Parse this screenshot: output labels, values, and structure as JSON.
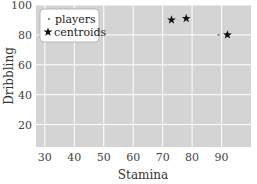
{
  "chart_data": {
    "type": "scatter",
    "title": "",
    "xlabel": "Stamina",
    "ylabel": "Dribbling",
    "xlim": [
      27,
      100
    ],
    "ylim": [
      5,
      100
    ],
    "xticks": [
      30,
      40,
      50,
      60,
      70,
      80,
      90
    ],
    "yticks": [
      20,
      40,
      60,
      80,
      100
    ],
    "grid": true,
    "background": "#d4d4d4",
    "legend_position": "upper left",
    "series": [
      {
        "name": "players",
        "marker": "dot",
        "color": "#888888",
        "points": [
          [
            89,
            80
          ]
        ]
      },
      {
        "name": "centroids",
        "marker": "star",
        "color": "#111111",
        "points": [
          [
            73,
            90
          ],
          [
            78,
            91
          ],
          [
            92,
            80
          ]
        ]
      }
    ]
  }
}
